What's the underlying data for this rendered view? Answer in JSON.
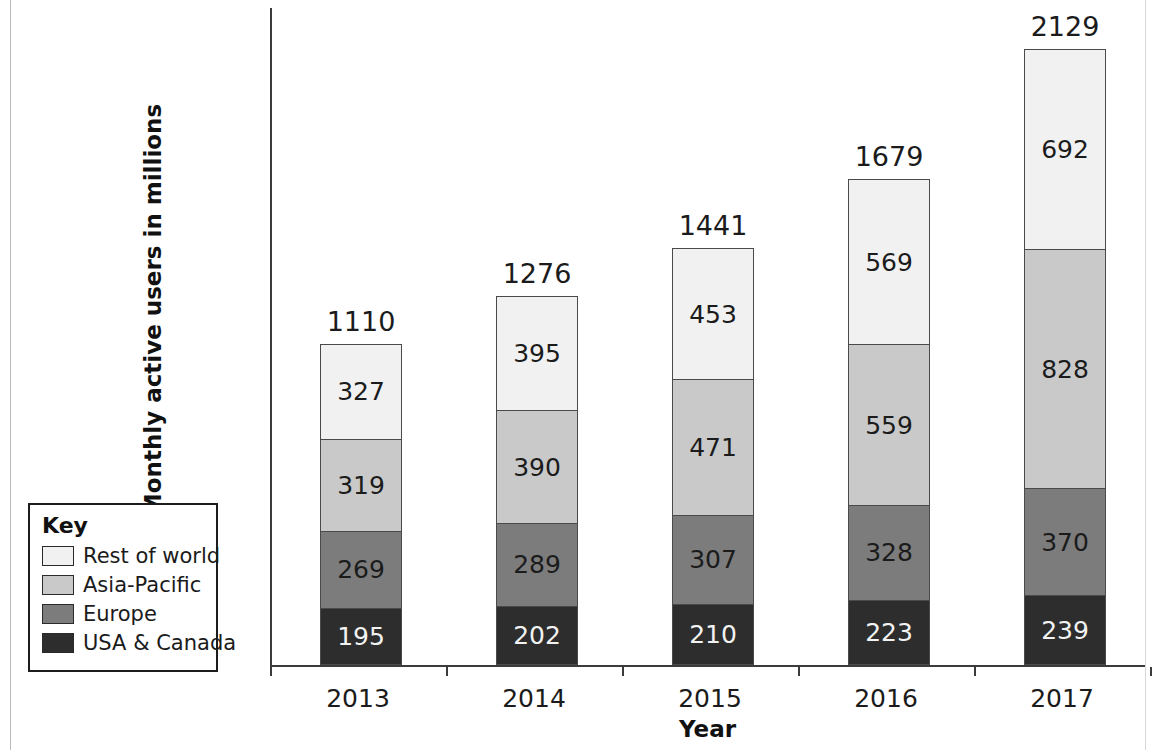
{
  "chart_data": {
    "type": "bar",
    "subtype": "stacked-bar",
    "title": "",
    "xlabel": "Year",
    "ylabel": "Monthly active users in millions",
    "categories": [
      "2013",
      "2014",
      "2015",
      "2016",
      "2017"
    ],
    "series": [
      {
        "name": "USA & Canada",
        "color": "#2d2d2d",
        "values": [
          195,
          202,
          210,
          223,
          239
        ]
      },
      {
        "name": "Europe",
        "color": "#7c7c7c",
        "values": [
          269,
          289,
          307,
          328,
          370
        ]
      },
      {
        "name": "Asia-Pacific",
        "color": "#c9c9c9",
        "values": [
          319,
          390,
          471,
          559,
          828
        ]
      },
      {
        "name": "Rest of world",
        "color": "#f1f1f1",
        "values": [
          327,
          395,
          453,
          569,
          692
        ]
      }
    ],
    "totals": [
      1110,
      1276,
      1441,
      1679,
      2129
    ],
    "stack_order_bottom_to_top": [
      "USA & Canada",
      "Europe",
      "Asia-Pacific",
      "Rest of world"
    ],
    "ylim": [
      0,
      2270
    ],
    "grid": false,
    "y_axis_ticks_shown": false,
    "data_labels": true,
    "total_labels": true,
    "legend_position": "left-outside"
  },
  "axes": {
    "y_title": "Monthly active users in millions",
    "x_title": "Year",
    "x_tick_labels": [
      "2013",
      "2014",
      "2015",
      "2016",
      "2017"
    ]
  },
  "legend": {
    "title": "Key",
    "items": [
      {
        "label": "Rest of world",
        "color": "#f1f1f1"
      },
      {
        "label": "Asia-Pacific",
        "color": "#c9c9c9"
      },
      {
        "label": "Europe",
        "color": "#7c7c7c"
      },
      {
        "label": "USA & Canada",
        "color": "#2d2d2d"
      }
    ]
  },
  "bars": [
    {
      "category": "2013",
      "total": "1110",
      "segments": [
        {
          "name": "Rest of world",
          "value": "327"
        },
        {
          "name": "Asia-Pacific",
          "value": "319"
        },
        {
          "name": "Europe",
          "value": "269"
        },
        {
          "name": "USA & Canada",
          "value": "195"
        }
      ]
    },
    {
      "category": "2014",
      "total": "1276",
      "segments": [
        {
          "name": "Rest of world",
          "value": "395"
        },
        {
          "name": "Asia-Pacific",
          "value": "390"
        },
        {
          "name": "Europe",
          "value": "289"
        },
        {
          "name": "USA & Canada",
          "value": "202"
        }
      ]
    },
    {
      "category": "2015",
      "total": "1441",
      "segments": [
        {
          "name": "Rest of world",
          "value": "453"
        },
        {
          "name": "Asia-Pacific",
          "value": "471"
        },
        {
          "name": "Europe",
          "value": "307"
        },
        {
          "name": "USA & Canada",
          "value": "210"
        }
      ]
    },
    {
      "category": "2016",
      "total": "1679",
      "segments": [
        {
          "name": "Rest of world",
          "value": "569"
        },
        {
          "name": "Asia-Pacific",
          "value": "559"
        },
        {
          "name": "Europe",
          "value": "328"
        },
        {
          "name": "USA & Canada",
          "value": "223"
        }
      ]
    },
    {
      "category": "2017",
      "total": "2129",
      "segments": [
        {
          "name": "Rest of world",
          "value": "692"
        },
        {
          "name": "Asia-Pacific",
          "value": "828"
        },
        {
          "name": "Europe",
          "value": "370"
        },
        {
          "name": "USA & Canada",
          "value": "239"
        }
      ]
    }
  ]
}
